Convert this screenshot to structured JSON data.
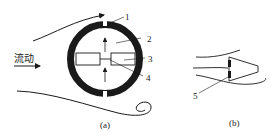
{
  "figure_a": {
    "caption": "(a)",
    "flow_label": "流动",
    "callouts": [
      "1",
      "2",
      "3",
      "4"
    ]
  },
  "figure_b": {
    "caption": "(b)",
    "callouts": [
      "5"
    ]
  },
  "colors": {
    "ink": "#1a1a1a",
    "background": "#ffffff"
  }
}
